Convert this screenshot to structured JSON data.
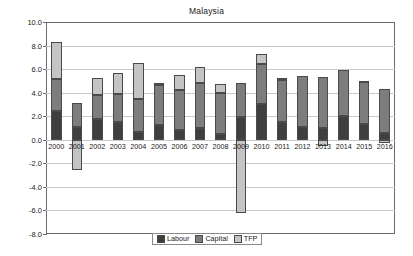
{
  "chart_data": {
    "type": "bar",
    "subtype": "stacked-bar-with-negatives",
    "title": "Malaysia",
    "xlabel": "",
    "ylabel": "",
    "ylim": [
      -8.0,
      10.0
    ],
    "ytick_step": 2.0,
    "ytick_labels": [
      "10.0",
      "8.0",
      "6.0",
      "4.0",
      "2.0",
      "0.0",
      "-2.0",
      "-4.0",
      "-6.0",
      "-8.0"
    ],
    "ytick_values": [
      10.0,
      8.0,
      6.0,
      4.0,
      2.0,
      0.0,
      -2.0,
      -4.0,
      -6.0,
      -8.0
    ],
    "grid": true,
    "legend_position": "bottom",
    "categories": [
      "2000",
      "2001",
      "2002",
      "2003",
      "2004",
      "2005",
      "2006",
      "2007",
      "2008",
      "2009",
      "2010",
      "2011",
      "2012",
      "2013",
      "2014",
      "2015",
      "2016"
    ],
    "series": [
      {
        "name": "Labour",
        "color": "#3f3f3f",
        "values": [
          2.45,
          1.05,
          1.8,
          1.55,
          0.7,
          1.25,
          0.85,
          1.0,
          0.45,
          1.9,
          3.05,
          1.55,
          1.1,
          1.0,
          2.0,
          1.3,
          0.6
        ]
      },
      {
        "name": "Capital",
        "color": "#7d7d7d",
        "values": [
          2.75,
          2.1,
          2.0,
          2.3,
          2.8,
          3.4,
          3.4,
          3.8,
          3.5,
          2.95,
          3.35,
          3.55,
          4.35,
          4.3,
          3.95,
          3.6,
          3.75
        ]
      },
      {
        "name": "TFP",
        "color": "#c4c4c4",
        "values": [
          3.1,
          -2.6,
          1.45,
          1.8,
          3.05,
          0.2,
          1.25,
          1.35,
          0.8,
          -6.2,
          0.9,
          0.15,
          0.0,
          -0.55,
          0.0,
          0.1,
          -0.25
        ]
      }
    ],
    "totals": [
      8.3,
      3.15,
      5.25,
      5.65,
      6.55,
      4.85,
      5.5,
      6.15,
      4.75,
      4.85,
      7.3,
      5.2,
      5.45,
      5.3,
      5.95,
      4.9,
      4.35
    ]
  },
  "legend": {
    "items": [
      {
        "label": "Labour"
      },
      {
        "label": "Capital"
      },
      {
        "label": "TFP"
      }
    ]
  }
}
